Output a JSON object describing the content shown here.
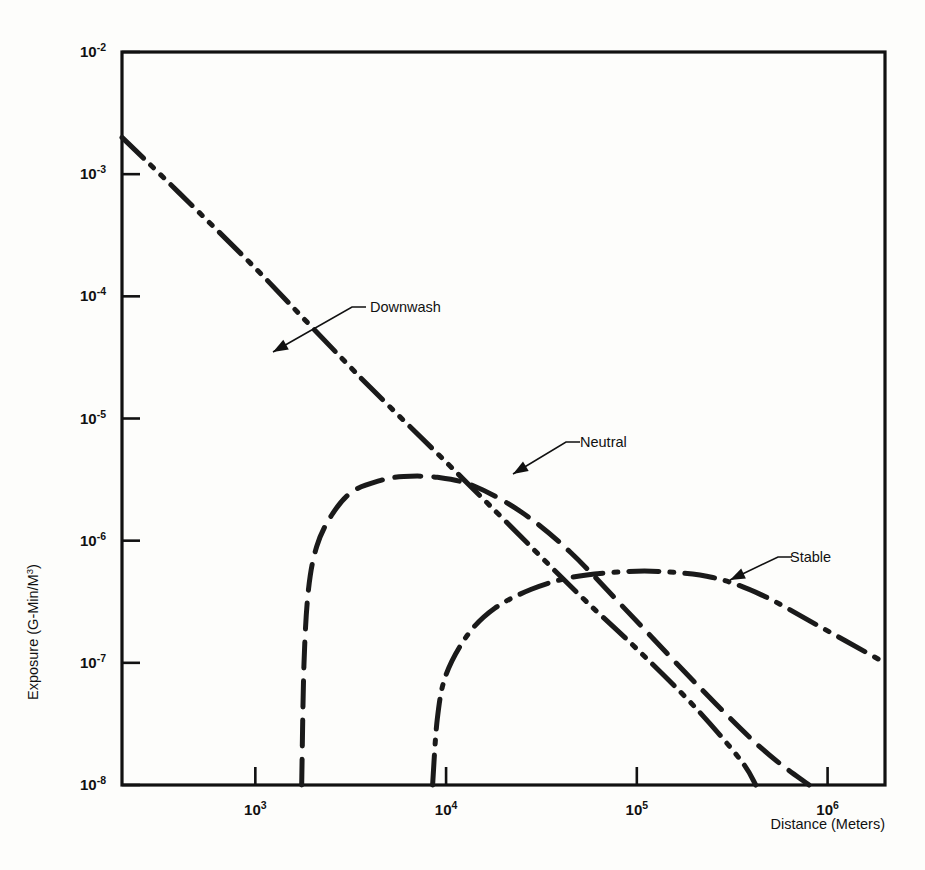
{
  "chart_data": {
    "type": "line",
    "title": "",
    "xlabel": "Distance (Meters)",
    "ylabel": "Exposure (G-Min/M3)",
    "ylabel_parts": {
      "base": "Exposure (G-Min/M",
      "sup": "3",
      "tail": ")"
    },
    "xscale": "log",
    "yscale": "log",
    "xlim": [
      200,
      2000000
    ],
    "ylim": [
      1e-08,
      0.01
    ],
    "grid": false,
    "legend": "inline annotations",
    "x_ticks": [
      {
        "value": 1000,
        "mantissa": "10",
        "exponent": "3",
        "label": "10^3"
      },
      {
        "value": 10000,
        "mantissa": "10",
        "exponent": "4",
        "label": "10^4"
      },
      {
        "value": 100000,
        "mantissa": "10",
        "exponent": "5",
        "label": "10^5"
      },
      {
        "value": 1000000,
        "mantissa": "10",
        "exponent": "6",
        "label": "10^6"
      }
    ],
    "y_ticks": [
      {
        "value": 0.01,
        "mantissa": "10",
        "exponent": "-2",
        "label": "10^-2"
      },
      {
        "value": 0.001,
        "mantissa": "10",
        "exponent": "-3",
        "label": "10^-3"
      },
      {
        "value": 0.0001,
        "mantissa": "10",
        "exponent": "-4",
        "label": "10^-4"
      },
      {
        "value": 1e-05,
        "mantissa": "10",
        "exponent": "-5",
        "label": "10^-5"
      },
      {
        "value": 1e-06,
        "mantissa": "10",
        "exponent": "-6",
        "label": "10^-6"
      },
      {
        "value": 1e-07,
        "mantissa": "10",
        "exponent": "-7",
        "label": "10^-7"
      },
      {
        "value": 1e-08,
        "mantissa": "10",
        "exponent": "-8",
        "label": "10^-8"
      }
    ],
    "series": [
      {
        "name": "Downwash",
        "style": "dash-dot-dot",
        "annotation": "Downwash",
        "points": [
          [
            200,
            0.002
          ],
          [
            400,
            0.0007
          ],
          [
            1000,
            0.00017
          ],
          [
            2000,
            5.5e-05
          ],
          [
            4000,
            1.8e-05
          ],
          [
            10000,
            4.4e-06
          ],
          [
            20000,
            1.5e-06
          ],
          [
            50000,
            3.6e-07
          ],
          [
            100000,
            1.3e-07
          ],
          [
            200000,
            4.4e-08
          ],
          [
            350000,
            1.6e-08
          ],
          [
            420000,
            1e-08
          ]
        ]
      },
      {
        "name": "Neutral",
        "style": "dashed",
        "annotation": "Neutral",
        "points": [
          [
            1750,
            1e-08
          ],
          [
            1800,
            1e-07
          ],
          [
            1900,
            4e-07
          ],
          [
            2100,
            9e-07
          ],
          [
            2500,
            1.6e-06
          ],
          [
            3200,
            2.5e-06
          ],
          [
            4500,
            3.1e-06
          ],
          [
            6000,
            3.35e-06
          ],
          [
            9000,
            3.3e-06
          ],
          [
            14000,
            2.8e-06
          ],
          [
            25000,
            1.7e-06
          ],
          [
            45000,
            8e-07
          ],
          [
            90000,
            2.6e-07
          ],
          [
            200000,
            7e-08
          ],
          [
            450000,
            2e-08
          ],
          [
            800000,
            1e-08
          ]
        ]
      },
      {
        "name": "Stable",
        "style": "dash-dot",
        "annotation": "Stable",
        "points": [
          [
            8500,
            1e-08
          ],
          [
            9000,
            3.5e-08
          ],
          [
            10000,
            8e-08
          ],
          [
            13000,
            1.7e-07
          ],
          [
            18000,
            2.8e-07
          ],
          [
            28000,
            4e-07
          ],
          [
            45000,
            5e-07
          ],
          [
            75000,
            5.5e-07
          ],
          [
            130000,
            5.6e-07
          ],
          [
            250000,
            5e-07
          ],
          [
            450000,
            3.6e-07
          ],
          [
            900000,
            2e-07
          ],
          [
            2000000,
            1e-07
          ]
        ]
      }
    ],
    "annotations": [
      {
        "label": "Downwash",
        "text_x": 370,
        "text_y": 312,
        "arrow_from_x": 352,
        "arrow_from_y": 318,
        "arrow_to_x": 273,
        "arrow_to_y": 352
      },
      {
        "label": "Neutral",
        "text_x": 580,
        "text_y": 447,
        "arrow_from_x": 566,
        "arrow_from_y": 452,
        "arrow_to_x": 513,
        "arrow_to_y": 474
      },
      {
        "label": "Stable",
        "text_x": 790,
        "text_y": 562,
        "arrow_from_x": 778,
        "arrow_from_y": 568,
        "arrow_to_x": 730,
        "arrow_to_y": 580
      }
    ]
  },
  "figure": {
    "x_axis_title": "Distance (Meters)",
    "y_axis_title_base": "Exposure (G-Min/M",
    "y_axis_title_sup": "3",
    "y_axis_title_tail": ")",
    "frame_color": "#111111",
    "line_color": "#1a1a1a",
    "background": "#fdfdfb"
  }
}
